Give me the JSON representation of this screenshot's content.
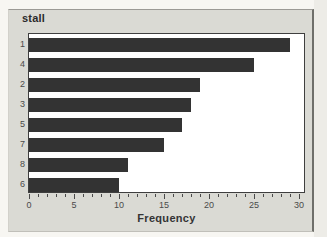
{
  "page": {
    "background": "#f7f6f2",
    "right_strip": "#edece7"
  },
  "panel": {
    "background": "#dadad4",
    "edge_color": "#6f6f6a"
  },
  "chart_data": {
    "type": "bar",
    "orientation": "horizontal",
    "title": "stall",
    "categories": [
      "1",
      "4",
      "2",
      "3",
      "5",
      "7",
      "8",
      "6"
    ],
    "values": [
      29,
      25,
      19,
      18,
      17,
      15,
      11,
      10
    ],
    "xlabel": "Frequency",
    "ylabel": "stall",
    "xlim": [
      0,
      30.5
    ],
    "x_major_ticks": [
      0,
      5,
      10,
      15,
      20,
      25,
      30
    ],
    "x_minor_tick_interval": 1,
    "bar_color": "#333333",
    "plot_background": "#ffffff",
    "grid": "off",
    "legend": "none"
  }
}
